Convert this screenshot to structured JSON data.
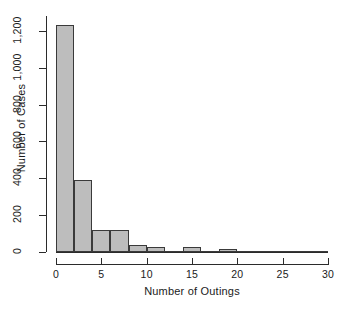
{
  "chart_data": {
    "type": "bar",
    "title": "",
    "subtitle": "",
    "xlabel": "Number of Outings",
    "ylabel": "Number of Cases",
    "grid": false,
    "legend": null,
    "xlim": [
      0,
      30
    ],
    "ylim": [
      0,
      1280
    ],
    "xticks": [
      0,
      5,
      10,
      15,
      20,
      25,
      30
    ],
    "xtick_labels": [
      "0",
      "5",
      "10",
      "15",
      "20",
      "25",
      "30"
    ],
    "yticks": [
      0,
      200,
      400,
      600,
      800,
      1000,
      1200
    ],
    "ytick_labels": [
      "0",
      "200",
      "400",
      "600",
      "800",
      "1,000",
      "1,200"
    ],
    "bin_width": 2,
    "bin_edges": [
      0,
      2,
      4,
      6,
      8,
      10,
      12,
      14,
      16,
      18,
      20,
      22,
      24,
      26,
      28,
      30
    ],
    "categories": [
      "0-2",
      "2-4",
      "4-6",
      "6-8",
      "8-10",
      "10-12",
      "12-14",
      "14-16",
      "16-18",
      "18-20",
      "20-22",
      "22-24",
      "24-26",
      "26-28",
      "28-30"
    ],
    "values": [
      1230,
      390,
      120,
      120,
      40,
      25,
      3,
      28,
      5,
      15,
      0,
      0,
      4,
      0,
      3
    ],
    "bar_color": "#bdbdbd",
    "bar_border_color": "#3a3a3a",
    "axis_color": "#2b2b2b"
  }
}
